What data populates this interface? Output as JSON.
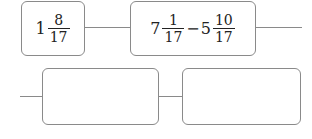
{
  "diagram": {
    "start_box": {
      "value": {
        "whole": "1",
        "numerator": "8",
        "denominator": "17"
      }
    },
    "expression_box": {
      "left": {
        "whole": "7",
        "numerator": "1",
        "denominator": "17"
      },
      "operator": "−",
      "right": {
        "whole": "5",
        "numerator": "10",
        "denominator": "17"
      }
    },
    "answer_box_1": {
      "value": ""
    },
    "answer_box_2": {
      "value": ""
    }
  },
  "colors": {
    "border": "#8a8a8a",
    "text": "#222222",
    "background": "#ffffff"
  }
}
